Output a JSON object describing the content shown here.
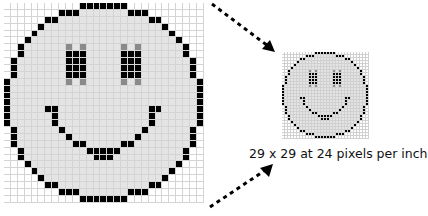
{
  "caption": "29 x 29 at 24 pixels per inch",
  "colors": {
    "background": "#ffffff",
    "face_fill": "#e4e4e4",
    "outline": "#000000",
    "antialias_gray": "#8a8a8a",
    "grid_line": "#d4d4d4"
  },
  "bitmap": {
    "width": 29,
    "height": 29,
    "legend": {
      "0": "outside",
      "1": "face",
      "2": "black",
      "3": "gray"
    },
    "rows": [
      "00000000000222222200000000000",
      "00000000222111111122200000000",
      "00000022111111111111122000000",
      "00000211111111111111111200000",
      "00002111111111111111111120000",
      "00021111111111111111111112000",
      "00211111131311111313111111200",
      "00211111122211111222111111200",
      "02111111122211111222111111120",
      "02111111122211111222111111120",
      "02111111122211111222111111120",
      "21111111131311111313111111112",
      "21111111111111111111111111112",
      "21111111111111111111111111112",
      "21111111111111111111111111112",
      "21111122111111111111122111112",
      "21111112111111111111121111112",
      "21111112111111111111121111112",
      "02111111211111111111211111120",
      "02111111121111111112111111120",
      "02111111112211111221111111120",
      "00211111111122222111111111200",
      "00211111111112221111111111200",
      "00021111111111111111111112000",
      "00002111111111111111111120000",
      "00000211111111111111111200000",
      "00000022111111111111122000000",
      "00000000222111111122200000000",
      "00000000000222222200000000000"
    ]
  }
}
